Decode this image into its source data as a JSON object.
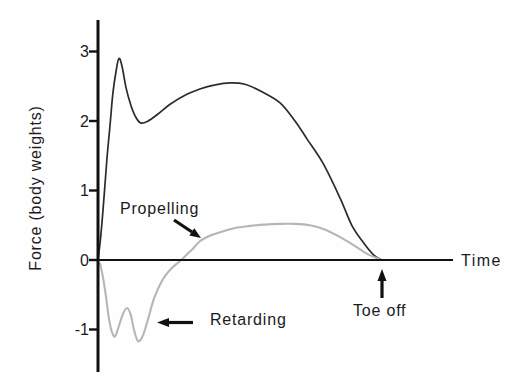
{
  "figure": {
    "background": "#fefefe",
    "ink_color": "#1b1b1b",
    "gray_curve_color": "#b6b6b6"
  },
  "axes": {
    "y_label": "Force (body weights)",
    "x_label": "Time",
    "y_ticks": [
      {
        "label": "3",
        "value": 3
      },
      {
        "label": "2",
        "value": 2
      },
      {
        "label": "1",
        "value": 1
      },
      {
        "label": "0",
        "value": 0
      },
      {
        "label": "-1",
        "value": -1
      }
    ]
  },
  "annotations": {
    "propelling": "Propelling",
    "retarding": "Retarding",
    "toe_off": "Toe off"
  },
  "chart_data": {
    "type": "line",
    "title": "",
    "xlabel": "Time",
    "ylabel": "Force (body weights)",
    "ylim": [
      -1.5,
      3.5
    ],
    "xlim": [
      0,
      1
    ],
    "grid": false,
    "legend": "none",
    "x_units": "normalized stance time (toe off at t = 0.8, axis extends to 1.0)",
    "events": [
      {
        "label": "Toe off",
        "t": 0.8,
        "force": 0
      }
    ],
    "series": [
      {
        "name": "Resultant ground-reaction force",
        "id": "total-force-curve",
        "color": "#2b2b2b",
        "style": "solid",
        "points": [
          [
            0.0,
            0.0
          ],
          [
            0.008,
            0.35
          ],
          [
            0.017,
            0.9
          ],
          [
            0.025,
            1.45
          ],
          [
            0.034,
            1.95
          ],
          [
            0.042,
            2.4
          ],
          [
            0.051,
            2.72
          ],
          [
            0.059,
            2.9
          ],
          [
            0.068,
            2.78
          ],
          [
            0.079,
            2.48
          ],
          [
            0.093,
            2.22
          ],
          [
            0.107,
            2.05
          ],
          [
            0.121,
            1.97
          ],
          [
            0.141,
            2.0
          ],
          [
            0.169,
            2.1
          ],
          [
            0.203,
            2.24
          ],
          [
            0.245,
            2.37
          ],
          [
            0.287,
            2.46
          ],
          [
            0.33,
            2.52
          ],
          [
            0.372,
            2.55
          ],
          [
            0.414,
            2.53
          ],
          [
            0.462,
            2.42
          ],
          [
            0.513,
            2.26
          ],
          [
            0.555,
            2.0
          ],
          [
            0.589,
            1.74
          ],
          [
            0.634,
            1.39
          ],
          [
            0.682,
            0.89
          ],
          [
            0.715,
            0.5
          ],
          [
            0.749,
            0.24
          ],
          [
            0.777,
            0.07
          ],
          [
            0.8,
            0.0
          ]
        ]
      },
      {
        "name": "Horizontal force (retarding / propelling)",
        "id": "horizontal-force-curve",
        "color": "#b6b6b6",
        "style": "light",
        "points": [
          [
            0.006,
            -0.05
          ],
          [
            0.014,
            -0.25
          ],
          [
            0.023,
            -0.55
          ],
          [
            0.031,
            -0.85
          ],
          [
            0.039,
            -1.03
          ],
          [
            0.048,
            -1.1
          ],
          [
            0.059,
            -0.95
          ],
          [
            0.07,
            -0.78
          ],
          [
            0.082,
            -0.69
          ],
          [
            0.093,
            -0.8
          ],
          [
            0.101,
            -1.0
          ],
          [
            0.113,
            -1.17
          ],
          [
            0.127,
            -1.08
          ],
          [
            0.141,
            -0.85
          ],
          [
            0.158,
            -0.55
          ],
          [
            0.18,
            -0.3
          ],
          [
            0.203,
            -0.14
          ],
          [
            0.234,
            0.0
          ],
          [
            0.265,
            0.15
          ],
          [
            0.287,
            0.27
          ],
          [
            0.315,
            0.35
          ],
          [
            0.344,
            0.4
          ],
          [
            0.386,
            0.46
          ],
          [
            0.428,
            0.49
          ],
          [
            0.47,
            0.51
          ],
          [
            0.513,
            0.52
          ],
          [
            0.555,
            0.52
          ],
          [
            0.597,
            0.5
          ],
          [
            0.639,
            0.44
          ],
          [
            0.682,
            0.33
          ],
          [
            0.724,
            0.2
          ],
          [
            0.761,
            0.08
          ],
          [
            0.8,
            0.0
          ]
        ]
      }
    ]
  }
}
